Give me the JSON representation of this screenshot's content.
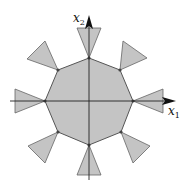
{
  "diagram": {
    "axes": {
      "x1_label": "x",
      "x1_sub": "1",
      "x2_label": "x",
      "x2_sub": "2"
    },
    "colors": {
      "fill": "#c4c4c4",
      "stroke": "#555555",
      "axis": "#222222"
    },
    "octagon_vertices": [
      [
        89,
        58
      ],
      [
        120,
        70
      ],
      [
        133,
        101
      ],
      [
        121,
        132
      ],
      [
        89,
        145
      ],
      [
        58,
        132
      ],
      [
        45,
        101
      ],
      [
        58,
        70
      ]
    ]
  }
}
